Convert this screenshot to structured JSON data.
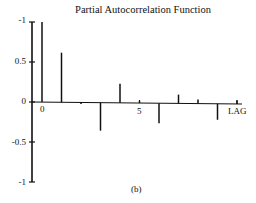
{
  "chart_data": {
    "type": "bar",
    "title": "Partial Autocorrelation Function",
    "caption": "(b)",
    "xlabel": "LAG",
    "ylabel": "",
    "x_tick_labels": [
      "0",
      "5"
    ],
    "y_tick_labels": [
      "-1",
      "0.5",
      "0",
      "-0.5",
      "-1"
    ],
    "y_tick_values": [
      1,
      0.5,
      0,
      -0.5,
      -1
    ],
    "ylim": [
      -1,
      1
    ],
    "xlim": [
      0,
      10
    ],
    "grid": false,
    "legend": null,
    "categories": [
      0,
      1,
      2,
      3,
      4,
      5,
      6,
      7,
      8,
      9,
      10
    ],
    "values": [
      1.0,
      0.62,
      -0.02,
      -0.35,
      0.24,
      0.03,
      -0.25,
      0.11,
      0.05,
      -0.2,
      0.05
    ]
  },
  "labels": {
    "title": "Partial Autocorrelation Function",
    "caption": "(b)",
    "xlabel": "LAG",
    "yticks": [
      "-1",
      "0.5",
      "0",
      "-0.5",
      "-1"
    ],
    "xticks": [
      "0",
      "5"
    ]
  }
}
